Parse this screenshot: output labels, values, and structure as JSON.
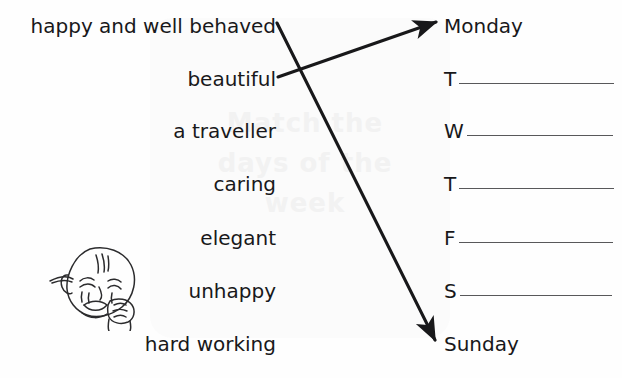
{
  "worksheet": {
    "background_color": "#fefefe",
    "ink_color": "#18181a",
    "rule_color": "#58585a",
    "watermark_color": "#f2f2f2",
    "watermark_lines": [
      "Match the",
      "days of the",
      "week"
    ]
  },
  "descriptions": {
    "label": "Description phrases",
    "items": [
      {
        "text": "happy and well behaved",
        "y": 32
      },
      {
        "text": "beautiful",
        "y": 85
      },
      {
        "text": "a traveller",
        "y": 137
      },
      {
        "text": "caring",
        "y": 190
      },
      {
        "text": "elegant",
        "y": 244
      },
      {
        "text": "unhappy",
        "y": 297
      },
      {
        "text": "hard working",
        "y": 350
      }
    ]
  },
  "days": {
    "label": "Days of the week",
    "items": [
      {
        "initial": "Monday",
        "blank": false,
        "rule_width": 0,
        "y": 32
      },
      {
        "initial": "T",
        "blank": true,
        "rule_width": 155,
        "y": 85
      },
      {
        "initial": "W",
        "blank": true,
        "rule_width": 146,
        "y": 137
      },
      {
        "initial": "T",
        "blank": true,
        "rule_width": 155,
        "y": 190
      },
      {
        "initial": "F",
        "blank": true,
        "rule_width": 154,
        "y": 244
      },
      {
        "initial": "S",
        "blank": true,
        "rule_width": 152,
        "y": 297
      },
      {
        "initial": "Sunday",
        "blank": false,
        "rule_width": 0,
        "y": 350
      }
    ]
  },
  "arrows": [
    {
      "name": "arrow-happy-to-sunday",
      "from_label": "happy and well behaved",
      "to_label": "Sunday",
      "x1": 277,
      "y1": 23,
      "x2": 438,
      "y2": 344
    },
    {
      "name": "arrow-beautiful-to-monday",
      "from_label": "beautiful",
      "to_label": "Monday",
      "x1": 278,
      "y1": 77,
      "x2": 440,
      "y2": 21
    }
  ],
  "illustration": {
    "name": "sad-child-face",
    "description": "line drawing of an unhappy child's face with hand at chin"
  }
}
